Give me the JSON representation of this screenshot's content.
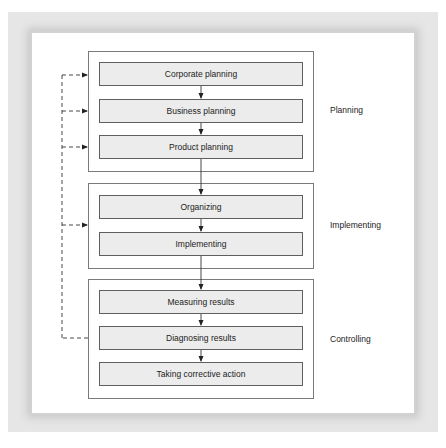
{
  "diagram": {
    "type": "flowchart",
    "groups": [
      {
        "id": "planning",
        "label": "Planning",
        "steps": [
          "Corporate planning",
          "Business planning",
          "Product planning"
        ]
      },
      {
        "id": "implementing",
        "label": "Implementing",
        "steps": [
          "Organizing",
          "Implementing"
        ]
      },
      {
        "id": "controlling",
        "label": "Controlling",
        "steps": [
          "Measuring results",
          "Diagnosing results",
          "Taking corrective action"
        ]
      }
    ],
    "feedback": {
      "from": "Diagnosing results",
      "to": [
        "Corporate planning",
        "Business planning",
        "Product planning",
        "Implementing group"
      ],
      "style": "dashed"
    },
    "colors": {
      "step_fill": "#ececec",
      "step_border": "#5f5f5f",
      "group_border": "#7a7a7a",
      "frame": "#e6e6e6",
      "text": "#222222"
    }
  }
}
